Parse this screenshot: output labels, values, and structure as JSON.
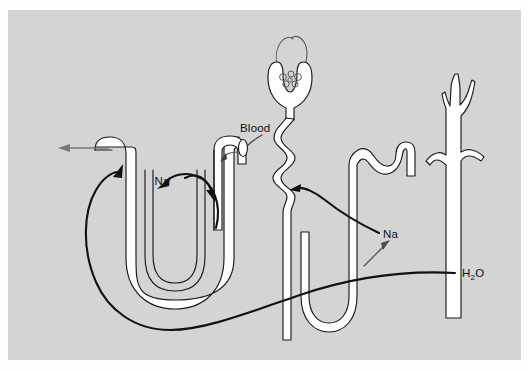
{
  "figure": {
    "domain": "Diagram",
    "kind": "nephron-transport-diagram",
    "background_color": "#d2d2d2",
    "page_color": "#fdfdfd",
    "ink_color": "#1a1a1a",
    "panel": {
      "x": 8,
      "y": 10,
      "width": 513,
      "height": 350
    }
  },
  "labels": {
    "blood": "Blood",
    "na_left": "Na",
    "na_right": "Na",
    "water_main": "H",
    "water_sub": "2",
    "water_tail": "O"
  },
  "structures": {
    "left_nephron": "loop-of-henle-left",
    "middle_nephron": "glomerulus-and-proximal-tubule",
    "right_nephron": "distal-tubule-and-loop",
    "collecting_duct": "collecting-duct"
  },
  "annotations": [
    {
      "name": "blood-leader",
      "label": "Blood",
      "points_to": "efferent-tubule-opening"
    },
    {
      "name": "na-left-loop-arrow",
      "label": "Na",
      "describes": "sodium-recycling-loop"
    },
    {
      "name": "na-right-arrow",
      "label": "Na",
      "describes": "sodium-transport-to-interstitium"
    },
    {
      "name": "h2o-sweep-arrow",
      "label": "H2O",
      "describes": "water-reabsorption-path"
    },
    {
      "name": "urine-outflow-arrow",
      "label": "",
      "describes": "outflow-at-left-tubule-opening"
    }
  ]
}
